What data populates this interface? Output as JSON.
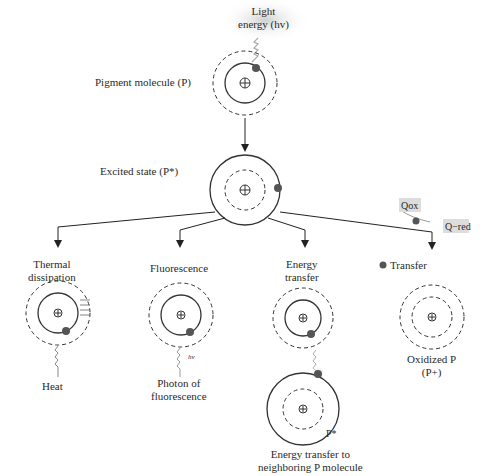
{
  "top": {
    "light_energy_line1": "Light",
    "light_energy_line2": "energy (hv)",
    "pigment_label": "Pigment molecule (P)"
  },
  "excited": {
    "label": "Excited state (P*)"
  },
  "quencher": {
    "ox": "Qox",
    "red": "Q−red"
  },
  "paths": [
    {
      "title_line1": "Thermal",
      "title_line2": "dissipation",
      "result": "Heat"
    },
    {
      "title_line1": "Fluorescence",
      "title_line2": "",
      "result_line1": "Photon of",
      "result_line2": "fluorescence",
      "hv": "hv"
    },
    {
      "title_line1": "Energy",
      "title_line2": "transfer",
      "pstar": "P*",
      "result_line1": "Energy transfer to",
      "result_line2": "neighboring P molecule"
    },
    {
      "title_line1": "Transfer",
      "result_line1": "Oxidized P",
      "result_line2": "(P+)"
    }
  ],
  "colors": {
    "line": "#3a3a3a",
    "electron": "#555555",
    "glow": "#d9d9d9"
  }
}
